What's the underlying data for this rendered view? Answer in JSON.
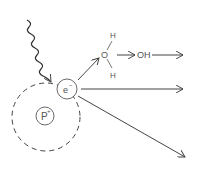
{
  "diagram": {
    "photon": {
      "label": ""
    },
    "electron": {
      "label": "e",
      "charge": "−"
    },
    "proton": {
      "label": "P",
      "charge": "+"
    },
    "water": {
      "oxygen": "O",
      "h_top": "H",
      "h_bottom": "H"
    },
    "product": {
      "label": "OH"
    },
    "colors": {
      "stroke": "#444444",
      "text": "#555555",
      "background": "#ffffff"
    }
  }
}
